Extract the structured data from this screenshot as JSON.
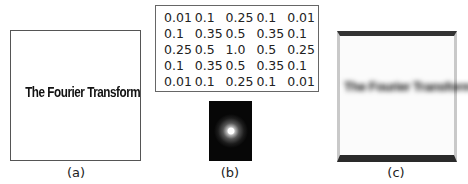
{
  "panels": {
    "a": {
      "caption": "(a)",
      "image_text": "The Fourier Transform"
    },
    "b": {
      "caption": "(b)",
      "kernel": [
        [
          "0.01",
          "0.1",
          "0.25",
          "0.1",
          "0.01"
        ],
        [
          "0.1",
          "0.35",
          "0.5",
          "0.35",
          "0.1"
        ],
        [
          "0.25",
          "0.5",
          "1.0",
          "0.5",
          "0.25"
        ],
        [
          "0.1",
          "0.35",
          "0.5",
          "0.35",
          "0.1"
        ],
        [
          "0.01",
          "0.1",
          "0.25",
          "0.1",
          "0.01"
        ]
      ],
      "image": "kernel-visualization-dark-with-bright-center"
    },
    "c": {
      "caption": "(c)",
      "image_text": "The Fourier Transform",
      "effect": "blurred"
    }
  },
  "colors": {
    "background": "#ffffff",
    "border": "#555555",
    "kernel_bg": "#070707"
  }
}
